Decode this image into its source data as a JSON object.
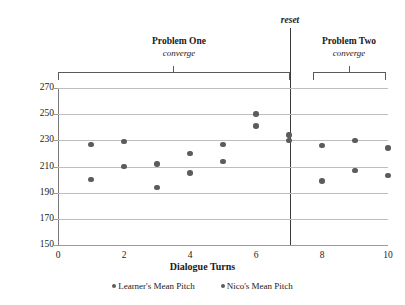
{
  "chart_data": {
    "type": "scatter",
    "title": "",
    "xlabel": "Dialogue Turns",
    "ylabel": "Pitch (Hz)",
    "xlim": [
      0,
      10
    ],
    "ylim": [
      150,
      270
    ],
    "xticks": [
      "0",
      "2",
      "4",
      "6",
      "8",
      "10"
    ],
    "yticks": [
      "150",
      "170",
      "190",
      "210",
      "230",
      "250",
      "270"
    ],
    "grid": true,
    "legend_position": "bottom",
    "x": [
      1,
      2,
      3,
      4,
      5,
      6,
      7,
      8,
      9,
      10
    ],
    "series": [
      {
        "name": "Learner's Mean Pitch",
        "values": [
          227,
          229,
          212,
          220,
          227,
          250,
          234,
          226,
          230,
          224
        ]
      },
      {
        "name": "Nico's Mean Pitch",
        "values": [
          200,
          210,
          194,
          205,
          214,
          241,
          230,
          199,
          207,
          203
        ]
      }
    ],
    "annotations": [
      {
        "id": "reset",
        "label": "reset",
        "x": 7.5,
        "style": "vertical-line"
      },
      {
        "id": "problem-one",
        "label": "Problem One",
        "sublabel": "converge",
        "x_start": 0.05,
        "x_end": 7.3
      },
      {
        "id": "problem-two",
        "label": "Problem Two",
        "sublabel": "converge",
        "x_start": 7.8,
        "x_end": 10.0
      }
    ],
    "marker_color": "#5c5c5c",
    "gridline_color": "#bdbdbd"
  },
  "legend": {
    "items": [
      {
        "label": "Learner's Mean Pitch"
      },
      {
        "label": "Nico's Mean Pitch"
      }
    ]
  },
  "axes": {
    "y_title": "Pitch (Hz)",
    "x_title": "Dialogue Turns"
  },
  "annotations": {
    "reset": "reset",
    "problem_one": "Problem One",
    "problem_one_sub": "converge",
    "problem_two": "Problem Two",
    "problem_two_sub": "converge"
  }
}
